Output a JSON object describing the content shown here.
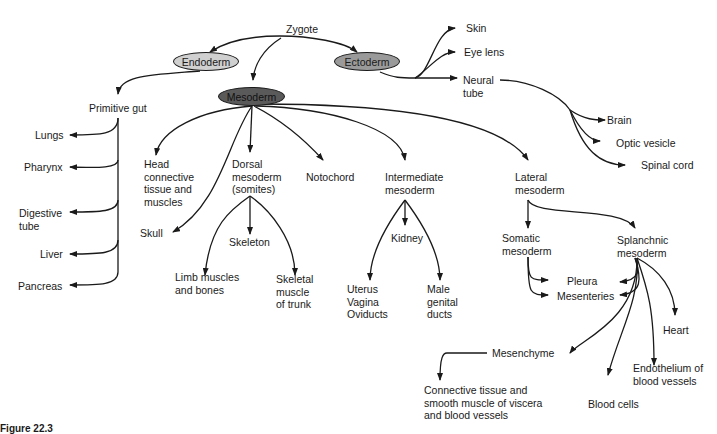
{
  "root": "Zygote",
  "germ_layers": {
    "endoderm": {
      "label": "Endoderm",
      "fill": "#d0d0d0"
    },
    "ectoderm": {
      "label": "Ectoderm",
      "fill": "#9a9a9a"
    },
    "mesoderm": {
      "label": "Mesoderm",
      "fill": "#5a5a5a"
    }
  },
  "ectoderm_derivatives": {
    "skin": "Skin",
    "eye_lens": "Eye lens",
    "neural_tube": "Neural\ntube",
    "brain": "Brain",
    "optic_vesicle": "Optic vesicle",
    "spinal_cord": "Spinal cord"
  },
  "endoderm_derivatives": {
    "primitive_gut": "Primitive gut",
    "lungs": "Lungs",
    "pharynx": "Pharynx",
    "digestive_tube": "Digestive\ntube",
    "liver": "Liver",
    "pancreas": "Pancreas"
  },
  "mesoderm_derivatives": {
    "head": "Head\nconnective\ntissue and\nmuscles",
    "skull": "Skull",
    "dorsal": "Dorsal\nmesoderm\n(somites)",
    "skeleton": "Skeleton",
    "limb": "Limb muscles\nand bones",
    "skeletal_muscle": "Skeletal\nmuscle\nof trunk",
    "notochord": "Notochord",
    "intermediate": "Intermediate\nmesoderm",
    "kidney": "Kidney",
    "uterus": "Uterus\nVagina\nOviducts",
    "male": "Male\ngenital\nducts",
    "lateral": "Lateral\nmesoderm",
    "somatic": "Somatic\nmesoderm",
    "splanchnic": "Splanchnic\nmesoderm",
    "pleura": "Pleura",
    "mesenteries": "Mesenteries",
    "heart": "Heart",
    "mesenchyme": "Mesenchyme",
    "connective": "Connective tissue and\nsmooth muscle of viscera\nand blood vessels",
    "blood_cells": "Blood cells",
    "endothelium": "Endothelium of\nblood vessels"
  },
  "caption": "Figure 22.3"
}
